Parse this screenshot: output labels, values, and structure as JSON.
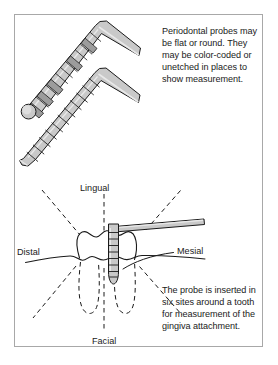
{
  "figure": {
    "border_color": "#a8a8a8",
    "background": "#ffffff"
  },
  "palette": {
    "probe_light": "#c9c9c9",
    "probe_band_dark": "#9c9c9c",
    "probe_outline": "#1a1a1a",
    "line": "#1a1a1a",
    "dashed": "#1a1a1a",
    "text": "#1a1a1a"
  },
  "captions": {
    "probes_description": "Periodontal probes may be flat or round. They may be color-coded or unetched in places to show measurement.",
    "sites_description": "The probe is inserted in six sites around a tooth for measurement of the gingiva attachment."
  },
  "tooth_labels": {
    "lingual": "Lingual",
    "distal": "Distal",
    "mesial": "Mesial",
    "facial": "Facial"
  },
  "diagrams": {
    "upper_probe": {
      "name": "round periodontal probe",
      "tip_shape": "round",
      "band_count": 11,
      "has_color_coded_bands": true
    },
    "lower_probe": {
      "name": "flat periodontal probe",
      "tip_shape": "tapered",
      "band_count": 11,
      "has_color_coded_bands": false
    },
    "inserted_probe": {
      "name": "probe inserted at gingival sulcus",
      "orientation": "vertical shaft with horizontal handle",
      "band_count": 9
    },
    "tooth": {
      "name": "molar cross-section",
      "root_count": 2,
      "measurement_site_count": 6
    }
  }
}
